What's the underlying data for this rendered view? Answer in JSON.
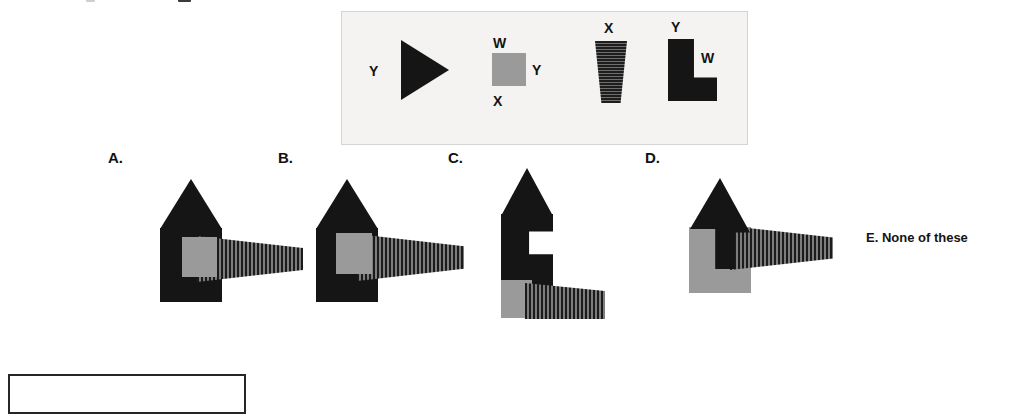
{
  "page": {
    "background": "#ffffff",
    "title_strip_note": "cut-off text descenders at top edge"
  },
  "stimulus": {
    "name": "shape-definition-panel",
    "background": "#f4f3f1",
    "border_color": "#d6d4d1",
    "items": [
      {
        "id": "triangle-right",
        "shape": "right-pointing-triangle",
        "fill": "#151515",
        "labels": [
          {
            "text": "Y",
            "position": "left"
          }
        ]
      },
      {
        "id": "gray-square",
        "shape": "square",
        "fill": "#9a9a9a",
        "labels": [
          {
            "text": "W",
            "position": "top"
          },
          {
            "text": "Y",
            "position": "right"
          },
          {
            "text": "X",
            "position": "bottom"
          }
        ]
      },
      {
        "id": "striped-trapezoid",
        "shape": "downward-tapering-trapezoid",
        "fill": "horizontal-stripes",
        "labels": [
          {
            "text": "X",
            "position": "top"
          }
        ]
      },
      {
        "id": "l-block",
        "shape": "L-shape",
        "fill": "#151515",
        "labels": [
          {
            "text": "Y",
            "position": "top"
          },
          {
            "text": "W",
            "position": "right"
          }
        ]
      }
    ]
  },
  "options": [
    {
      "id": "option-a",
      "label": "A.",
      "figure": "black-house-with-gray-square-and-striped-wedge"
    },
    {
      "id": "option-b",
      "label": "B.",
      "figure": "black-house-with-offset-gray-square-and-striped-wedge"
    },
    {
      "id": "option-c",
      "label": "C.",
      "figure": "black-notched-tower-with-gray-base-and-striped-wedge"
    },
    {
      "id": "option-d",
      "label": "D.",
      "figure": "black-arrow-over-gray-block-with-striped-wedge"
    },
    {
      "id": "option-e",
      "label": "E. None of these",
      "figure": "none"
    }
  ],
  "bottom_box": {
    "name": "partial-answer-box",
    "border_color": "#262626"
  }
}
